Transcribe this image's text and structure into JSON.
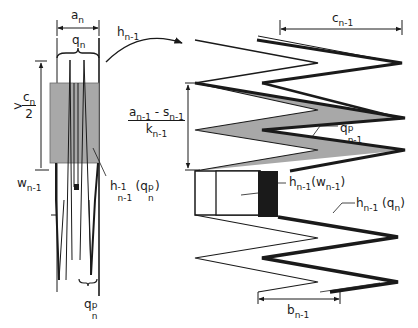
{
  "figure": {
    "type": "technical-diagram",
    "colors": {
      "line": "#1a1a1a",
      "shade_light": "#a8a8a8",
      "shade_dark": "#1a1a1a",
      "background": "#ffffff"
    }
  },
  "left_panel": {
    "width_label": {
      "base": "a",
      "sub": "n"
    },
    "brace_label": {
      "base": "q",
      "sub": "n"
    },
    "height_label": {
      "prefix": ">",
      "num_base": "c",
      "num_sub": "n",
      "den": "2"
    },
    "w_label": {
      "base": "w",
      "sub": "n-1"
    },
    "inverse_label": {
      "base": "h",
      "sup": "-1",
      "sub": "n-1",
      "arg_base": "(q",
      "arg_sup": "p",
      "arg_sub": "n",
      "close": ")"
    },
    "bottom_label": {
      "base": "q",
      "sup": "p",
      "sub": "n"
    }
  },
  "arrow": {
    "label": {
      "base": "h",
      "sub": "n-1"
    }
  },
  "right_panel": {
    "top_width_label": {
      "base": "c",
      "sub": "n-1"
    },
    "height_fraction": {
      "num_a": "a",
      "num_a_sub": "n-1",
      "minus": " - ",
      "num_s": "s",
      "num_s_sub": "n-1",
      "den_base": "k",
      "den_sub": "n-1"
    },
    "shaded_label": {
      "base": "q",
      "sup": "p",
      "sub": "n-1"
    },
    "box_label": {
      "base": "h",
      "sub": "n-1",
      "arg_base": "(w",
      "arg_sub": "n-1",
      "close": ")"
    },
    "thick_label": {
      "base": "h",
      "sub": "n-1",
      "arg_base": " (q",
      "arg_sub": "n",
      "close": ")"
    },
    "bottom_width_label": {
      "base": "b",
      "sub": "n-1"
    }
  }
}
